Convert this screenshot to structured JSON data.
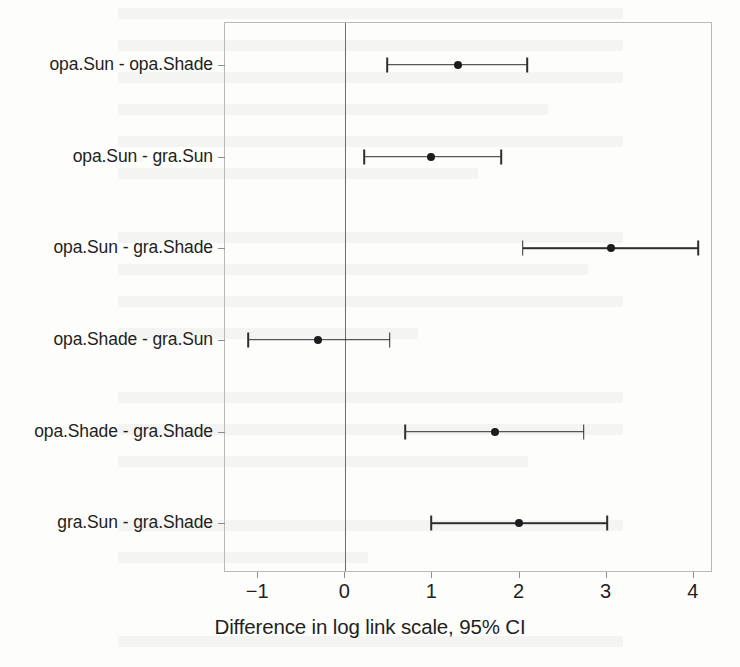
{
  "chart_data": {
    "type": "scatter",
    "subtype": "forest-plot-confidence-intervals",
    "title": "",
    "xlabel": "Difference in log link scale, 95% CI",
    "ylabel": "",
    "xlim": [
      -1.38,
      4.22
    ],
    "xticks": [
      -1,
      0,
      1,
      2,
      3,
      4
    ],
    "xtick_labels": [
      "−1",
      "0",
      "1",
      "2",
      "3",
      "4"
    ],
    "grid": false,
    "legend": null,
    "reference_line": 0,
    "categories": [
      "opa.Sun - opa.Shade",
      "opa.Sun - gra.Sun",
      "opa.Sun - gra.Shade",
      "opa.Shade - gra.Sun",
      "opa.Shade - gra.Shade",
      "gra.Sun - gra.Shade"
    ],
    "estimates": [
      1.3,
      1.0,
      3.06,
      -0.3,
      1.73,
      2.01
    ],
    "ci_lower": [
      0.49,
      0.23,
      2.05,
      -1.1,
      0.7,
      1.0
    ],
    "ci_upper": [
      2.1,
      1.8,
      4.06,
      0.52,
      2.75,
      3.02
    ],
    "points": [
      {
        "label": "opa.Sun - opa.Shade",
        "estimate": 1.3,
        "lower": 0.49,
        "upper": 2.1
      },
      {
        "label": "opa.Sun - gra.Sun",
        "estimate": 1.0,
        "lower": 0.23,
        "upper": 1.8
      },
      {
        "label": "opa.Sun - gra.Shade",
        "estimate": 3.06,
        "lower": 2.05,
        "upper": 4.06
      },
      {
        "label": "opa.Shade - gra.Sun",
        "estimate": -0.3,
        "lower": -1.1,
        "upper": 0.52
      },
      {
        "label": "opa.Shade - gra.Shade",
        "estimate": 1.73,
        "lower": 0.7,
        "upper": 2.75
      },
      {
        "label": "gra.Sun - gra.Shade",
        "estimate": 2.01,
        "lower": 1.0,
        "upper": 3.02
      }
    ],
    "colors": {
      "point": "#1c1c1c",
      "interval": "#2e2e2e",
      "frame": "#b9b9b9",
      "reference_line": "#6d6d6d",
      "background": "#fdfdfc",
      "text": "#231f20"
    }
  }
}
